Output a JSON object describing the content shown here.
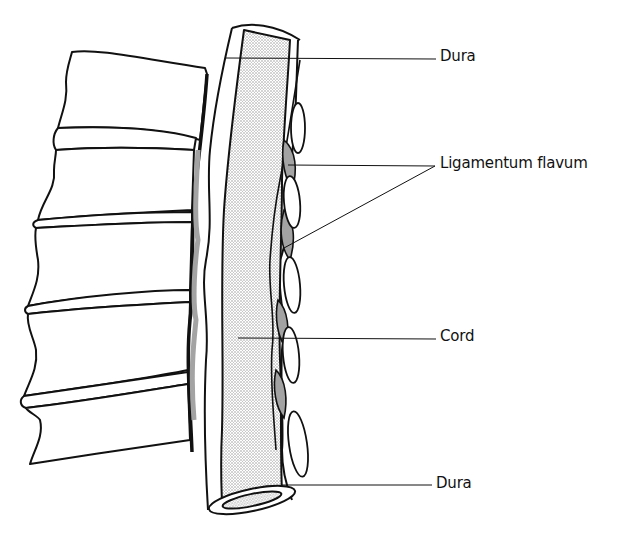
{
  "figure": {
    "labels": {
      "dura_top": "Dura",
      "ligamentum_flavum": "Ligamentum flavum",
      "cord": "Cord",
      "dura_bottom": "Dura"
    },
    "colors": {
      "line": "#111111",
      "stipple": "#9a9a9a",
      "background": "#ffffff"
    }
  }
}
